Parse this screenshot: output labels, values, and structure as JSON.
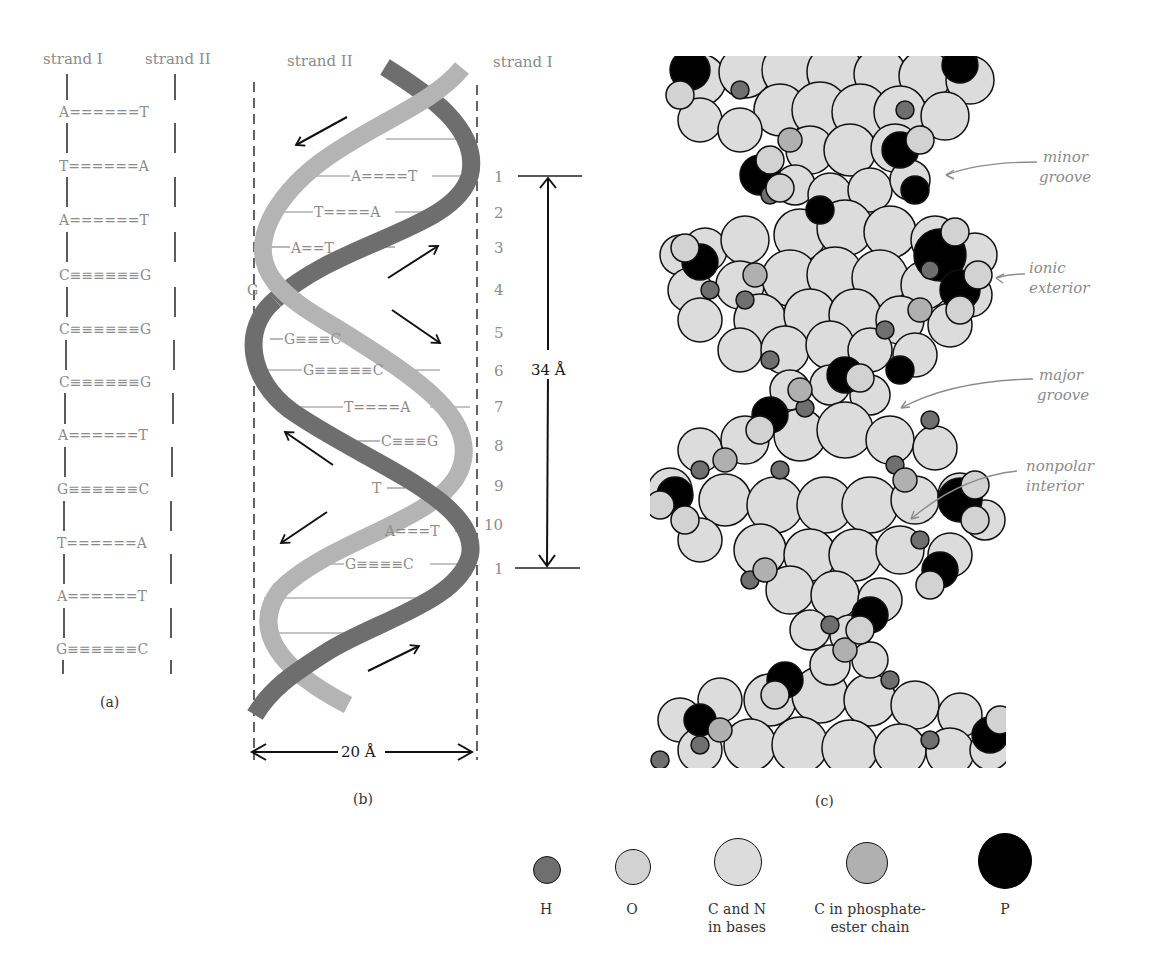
{
  "panel_a": {
    "caption": "(a)",
    "header_left": "strand I",
    "header_right": "strand II",
    "pairs": [
      {
        "left": "A",
        "bond": "======",
        "right": "T"
      },
      {
        "left": "T",
        "bond": "======",
        "right": "A"
      },
      {
        "left": "A",
        "bond": "======",
        "right": "T"
      },
      {
        "left": "C",
        "bond": "≡≡≡≡≡≡",
        "right": "G"
      },
      {
        "left": "C",
        "bond": "≡≡≡≡≡≡",
        "right": "G"
      },
      {
        "left": "C",
        "bond": "≡≡≡≡≡≡",
        "right": "G"
      },
      {
        "left": "A",
        "bond": "======",
        "right": "T"
      },
      {
        "left": "G",
        "bond": "≡≡≡≡≡≡",
        "right": "C"
      },
      {
        "left": "T",
        "bond": "======",
        "right": "A"
      },
      {
        "left": "A",
        "bond": "======",
        "right": "T"
      },
      {
        "left": "G",
        "bond": "≡≡≡≡≡≡",
        "right": "C"
      }
    ]
  },
  "panel_b": {
    "caption": "(b)",
    "header_left": "strand II",
    "header_right": "strand I",
    "pairs": [
      {
        "text": "A====T"
      },
      {
        "text": "T====A"
      },
      {
        "text": "A==T"
      },
      {
        "text": "G"
      },
      {
        "text": "G≡≡≡C"
      },
      {
        "text": "G≡≡≡≡≡C"
      },
      {
        "text": "T====A"
      },
      {
        "text": "C≡≡≡G"
      },
      {
        "text": "T"
      },
      {
        "text": "A===T"
      },
      {
        "text": "G≡≡≡≡C"
      }
    ],
    "numbers": [
      "1",
      "2",
      "3",
      "4",
      "5",
      "6",
      "7",
      "8",
      "9",
      "10",
      "1"
    ],
    "pitch_label": "34 Å",
    "width_label": "20 Å",
    "colors": {
      "strand_light": "#b4b4b4",
      "strand_dark": "#6e6e6e"
    }
  },
  "panel_c": {
    "caption": "(c)",
    "annotations": [
      {
        "line1": "minor",
        "line2": "groove"
      },
      {
        "line1": "ionic",
        "line2": "exterior"
      },
      {
        "line1": "major",
        "line2": "groove"
      },
      {
        "line1": "nonpolar",
        "line2": "interior"
      }
    ]
  },
  "legend": [
    {
      "symbol": "H",
      "line1": "H",
      "line2": "",
      "color": "#6f6f6f",
      "size": 26
    },
    {
      "symbol": "O",
      "line1": "O",
      "line2": "",
      "color": "#d2d2d2",
      "size": 36
    },
    {
      "symbol": "CN",
      "line1": "C and N",
      "line2": "in bases",
      "color": "#dcdcdc",
      "size": 50
    },
    {
      "symbol": "Cp",
      "line1": "C in phosphate-",
      "line2": "ester chain",
      "color": "#b0b0b0",
      "size": 44
    },
    {
      "symbol": "P",
      "line1": "P",
      "line2": "",
      "color": "#000000",
      "size": 56
    }
  ]
}
